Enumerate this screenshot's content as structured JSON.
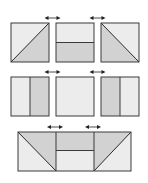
{
  "colors": {
    "light": "#ececec",
    "dark": "#d2d2d2",
    "stroke": "#3a3a3a",
    "arrow": "#222222"
  },
  "rows": [
    {
      "name": "row-1",
      "panels": [
        {
          "id": "diagonal-up",
          "split": "diagonal-bottom-left-to-top-right",
          "dark": "lower-right"
        },
        {
          "id": "horizontal",
          "split": "horizontal",
          "dark": "bottom"
        },
        {
          "id": "diagonal-down",
          "split": "diagonal-top-left-to-bottom-right",
          "dark": "lower-left"
        }
      ],
      "arrows": 2
    },
    {
      "name": "row-2",
      "panels": [
        {
          "id": "vertical-left",
          "split": "vertical",
          "dark": "right"
        },
        {
          "id": "blank",
          "split": "none",
          "dark": "none"
        },
        {
          "id": "vertical-right",
          "split": "vertical",
          "dark": "left"
        }
      ],
      "arrows": 2
    },
    {
      "name": "row-3",
      "panels": [
        {
          "id": "combined-strip",
          "split": "diagonal+horizontal+diagonal",
          "dark": "upper"
        }
      ],
      "arrows": 2
    }
  ],
  "arrow_glyph": "double-headed-arrow"
}
